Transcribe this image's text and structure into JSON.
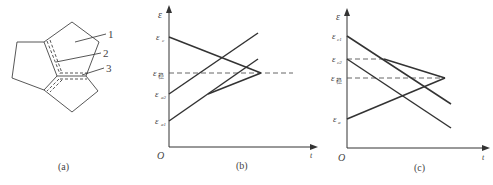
{
  "panel_a": {
    "caption": "(a)",
    "callouts": [
      "1",
      "2",
      "3"
    ]
  },
  "panel_b": {
    "caption": "(b)",
    "y_axis_label": "ε",
    "x_axis_label": "t",
    "origin_label": "O",
    "y_ticks": {
      "c": "ε",
      "c_sub": "c",
      "stable": "ε",
      "stable_sub": "稳",
      "a2": "ε",
      "a2_sub": "a2",
      "a1": "ε",
      "a1_sub": "a1"
    }
  },
  "panel_c": {
    "caption": "(c)",
    "y_axis_label": "ε",
    "x_axis_label": "t",
    "origin_label": "O",
    "y_ticks": {
      "c1": "ε",
      "c1_sub": "c1",
      "c2": "ε",
      "c2_sub": "c2",
      "stable": "ε",
      "stable_sub": "稳",
      "a": "ε",
      "a_sub": "a"
    }
  },
  "colors": {
    "line": "#333333",
    "dashed": "#555555",
    "text": "#444444"
  }
}
